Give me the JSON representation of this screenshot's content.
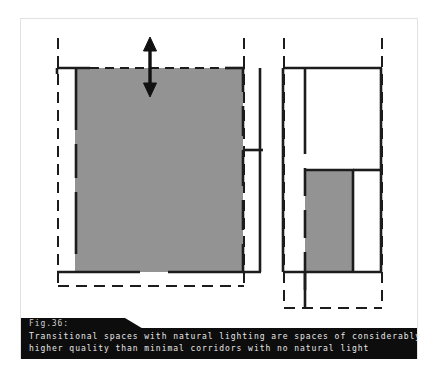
{
  "figure": {
    "number_label": "Fig.36:",
    "caption_lines": [
      "Transitional spaces with natural lighting are spaces of considerably",
      "higher quality than minimal corridors with no natural light"
    ],
    "caption_band_color": "#0d0d0d",
    "caption_text_color": "#e8e8e8"
  },
  "colors": {
    "background": "#ffffff",
    "page_border": "#e2e2e2",
    "wall_stroke": "#1c1c1c",
    "dashed_boundary": "#1c1c1c",
    "shaded_space_fill": "#939393",
    "arrow": "#111111"
  },
  "diagrams": [
    {
      "name": "left-plan-transitional-space",
      "description": "Plan with a large shaded transitional space spanning the full width, open to daylight at the perimeter",
      "shaded_space_label": "wide naturally lit transitional space",
      "annotation": {
        "type": "double-headed-vertical-arrow",
        "meaning": "width / depth of the transitional space"
      }
    },
    {
      "name": "right-plan-minimal-corridor",
      "description": "Plan with a narrow shaded corridor set deep in the plan with no natural light",
      "shaded_space_label": "narrow corridor with no natural light"
    }
  ]
}
